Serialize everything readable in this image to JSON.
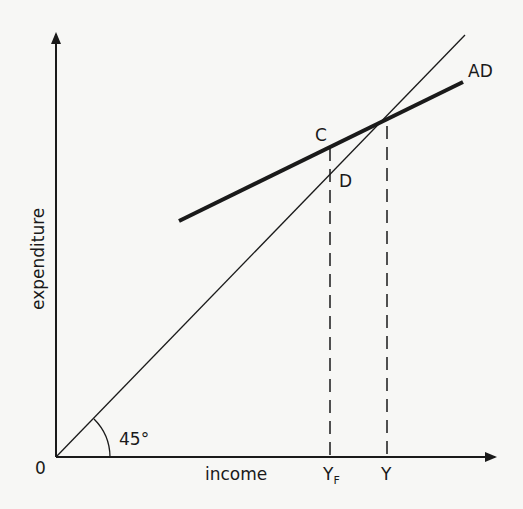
{
  "diagram": {
    "axes": {
      "x_label": "income",
      "y_label": "expenditure",
      "origin_label": "0"
    },
    "lines": {
      "forty_five": {
        "angle_label": "45°"
      },
      "aggregate_demand": {
        "label": "AD"
      }
    },
    "points": {
      "c": "C",
      "d": "D"
    },
    "x_ticks": {
      "yf_main": "Y",
      "yf_sub": "F",
      "y": "Y"
    }
  },
  "colors": {
    "ink": "#1a1a1a",
    "background": "#f7f7f5"
  }
}
